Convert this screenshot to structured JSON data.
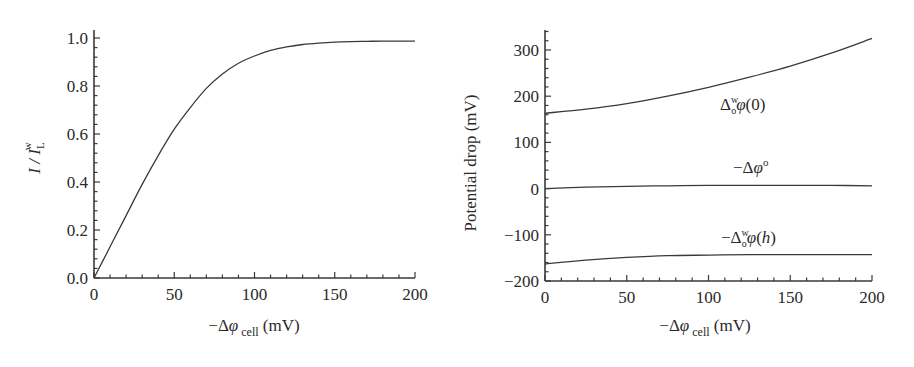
{
  "chart_data": [
    {
      "type": "line",
      "title": "",
      "xlabel": "−Δφ cell (mV)",
      "xlabel_parts": {
        "prefix": "−Δ",
        "symbol": "φ",
        "subscript": "cell",
        "unit": "(mV)"
      },
      "ylabel": "I / I_L^w",
      "ylabel_parts": {
        "main": "I / I",
        "subscript": "L",
        "superscript": "w"
      },
      "xlim": [
        0,
        200
      ],
      "ylim": [
        0,
        1.0
      ],
      "xticks": [
        "0",
        "50",
        "100",
        "150",
        "200"
      ],
      "yticks": [
        "0.0",
        "0.2",
        "0.4",
        "0.6",
        "0.8",
        "1.0"
      ],
      "grid": false,
      "series": [
        {
          "name": "I / I_L^w",
          "x": [
            0,
            10,
            20,
            30,
            40,
            50,
            60,
            70,
            80,
            90,
            100,
            110,
            120,
            130,
            140,
            150,
            160,
            170,
            180,
            190,
            200
          ],
          "y": [
            0.0,
            0.13,
            0.26,
            0.39,
            0.51,
            0.62,
            0.71,
            0.79,
            0.85,
            0.895,
            0.925,
            0.948,
            0.963,
            0.973,
            0.979,
            0.983,
            0.985,
            0.986,
            0.987,
            0.987,
            0.987
          ]
        }
      ]
    },
    {
      "type": "line",
      "title": "",
      "xlabel": "−Δφ cell (mV)",
      "xlabel_parts": {
        "prefix": "−Δ",
        "symbol": "φ",
        "subscript": "cell",
        "unit": "(mV)"
      },
      "ylabel": "Potential drop (mV)",
      "xlim": [
        0,
        200
      ],
      "ylim": [
        -200,
        340
      ],
      "xticks": [
        "0",
        "50",
        "100",
        "150",
        "200"
      ],
      "yticks": [
        "−200",
        "−100",
        "0",
        "100",
        "200",
        "300"
      ],
      "grid": false,
      "series": [
        {
          "name": "Δ_o^w φ(0)",
          "x": [
            0,
            25,
            50,
            75,
            100,
            125,
            150,
            175,
            200
          ],
          "y": [
            163,
            172,
            184,
            200,
            219,
            241,
            265,
            293,
            325
          ]
        },
        {
          "name": "−Δφ^o",
          "x": [
            0,
            25,
            50,
            75,
            100,
            125,
            150,
            175,
            200
          ],
          "y": [
            0,
            3,
            5,
            6,
            7,
            7,
            7,
            7,
            6
          ]
        },
        {
          "name": "−Δ_o^w φ(h)",
          "x": [
            0,
            25,
            50,
            75,
            100,
            125,
            150,
            175,
            200
          ],
          "y": [
            -163,
            -155,
            -149,
            -145,
            -144,
            -143,
            -143,
            -143,
            -143
          ]
        }
      ],
      "annotations": [
        {
          "text": "Δ_o^w φ(0)",
          "x": 135,
          "y": 130
        },
        {
          "text": "−Δφ^o",
          "x": 135,
          "y": 25
        },
        {
          "text": "−Δ_o^w φ(h)",
          "x": 135,
          "y": -110
        }
      ]
    }
  ],
  "labels": {
    "left_ylabel_main": "I / I",
    "left_ylabel_sub": "L",
    "left_ylabel_sup": "w",
    "right_ylabel": "Potential drop (mV)",
    "xlabel_prefix": "−Δ",
    "xlabel_symbol": "φ",
    "xlabel_sub": "cell",
    "xlabel_unit": " (mV)",
    "ann_top_delta": "Δ",
    "ann_top_sup": "w",
    "ann_top_sub": "o",
    "ann_top_phi": "φ",
    "ann_top_arg": "(0)",
    "ann_mid_prefix": "−Δ",
    "ann_mid_phi": "φ",
    "ann_mid_sup": "o",
    "ann_bot_prefix": "−Δ",
    "ann_bot_sup": "w",
    "ann_bot_sub": "o",
    "ann_bot_phi": "φ",
    "ann_bot_arg_open": "(",
    "ann_bot_arg_h": "h",
    "ann_bot_arg_close": ")"
  },
  "colors": {
    "axis": "#3a3a3a",
    "curve": "#3a3a3a",
    "text": "#2a2a2a"
  }
}
